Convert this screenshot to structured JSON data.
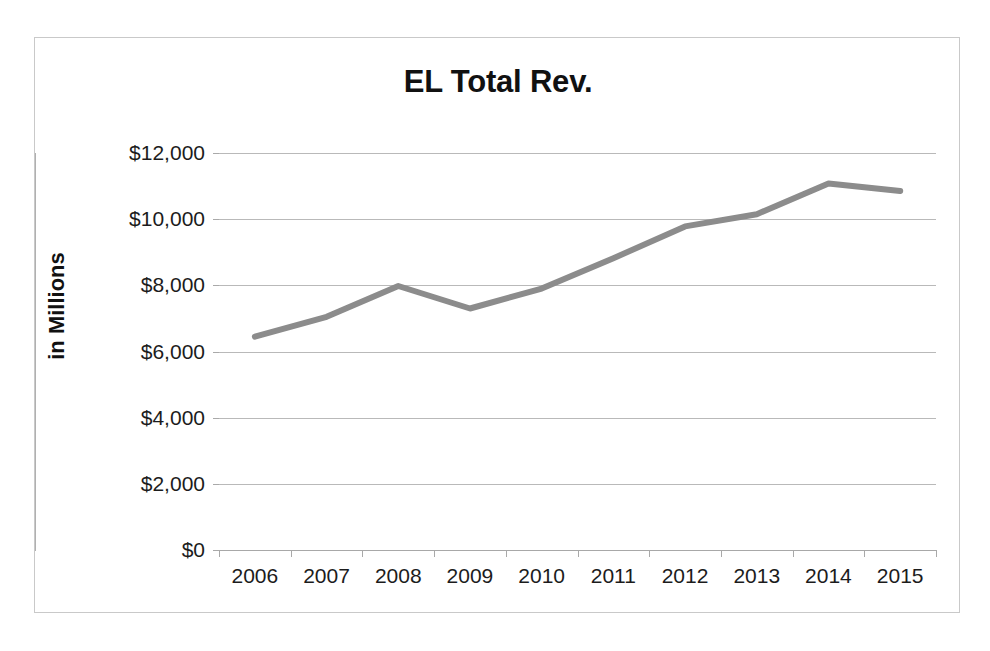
{
  "chart_data": {
    "type": "line",
    "title": "EL Total Rev.",
    "xlabel": "",
    "ylabel": "in Millions",
    "categories": [
      "2006",
      "2007",
      "2008",
      "2009",
      "2010",
      "2011",
      "2012",
      "2013",
      "2014",
      "2015"
    ],
    "series": [
      {
        "name": "EL Total Rev.",
        "values": [
          6450,
          7050,
          7980,
          7300,
          7900,
          8820,
          9780,
          10150,
          11080,
          10850
        ],
        "color": "#8c8c8c"
      }
    ],
    "ylim": [
      0,
      12000
    ],
    "ytick_values": [
      12000,
      10000,
      8000,
      6000,
      4000,
      2000,
      0
    ],
    "ytick_labels": [
      "$12,000",
      "$10,000",
      "$8,000",
      "$6,000",
      "$4,000",
      "$2,000",
      "$0"
    ],
    "grid": true,
    "legend": "none",
    "value_prefix": "$"
  },
  "style": {
    "line_color": "#8c8c8c",
    "grid_color": "#b9b9b9",
    "axis_color": "#a9a9a9",
    "frame_color": "#c9c9c9",
    "text_color": "#1c1c1c",
    "background": "#ffffff"
  }
}
